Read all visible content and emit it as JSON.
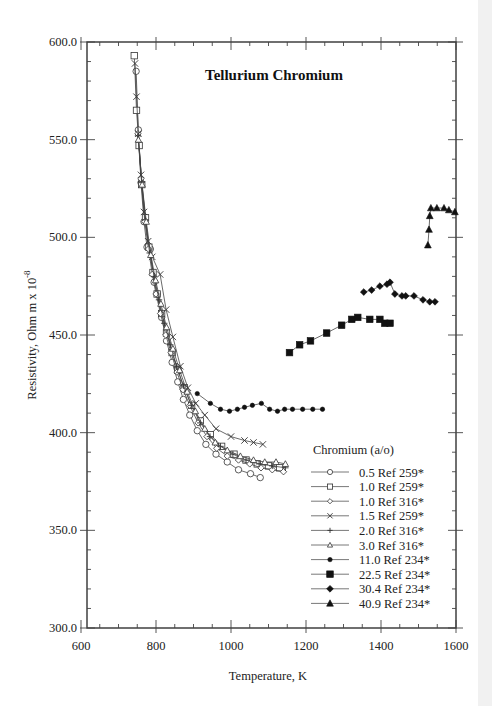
{
  "chart_data": {
    "type": "line",
    "title": "Tellurium  Chromium",
    "xlabel": "Temperature,  K",
    "ylabel": "Resistivity, Ohm m x 10",
    "ylabel_exponent": "-8",
    "xlim": [
      600,
      1600
    ],
    "ylim": [
      300,
      600
    ],
    "x_ticks": [
      "600",
      "800",
      "1000",
      "1200",
      "1400",
      "1600"
    ],
    "y_ticks": [
      "300.0",
      "350.0",
      "400.0",
      "450.0",
      "500.0",
      "550.0",
      "600.0"
    ],
    "grid": false,
    "legend_title": "Chromium (a/o)",
    "legend_position": "lower right",
    "series": [
      {
        "name": "0.5 Ref 259*",
        "marker": "circle-open",
        "points": [
          [
            747,
            585
          ],
          [
            753,
            555
          ],
          [
            760,
            528
          ],
          [
            768,
            508
          ],
          [
            776,
            495
          ],
          [
            785,
            494
          ],
          [
            795,
            477
          ],
          [
            803,
            471
          ],
          [
            815,
            459
          ],
          [
            828,
            447
          ],
          [
            843,
            436
          ],
          [
            858,
            426
          ],
          [
            873,
            417
          ],
          [
            890,
            409
          ],
          [
            910,
            401
          ],
          [
            933,
            394
          ],
          [
            960,
            389
          ],
          [
            990,
            385
          ],
          [
            1020,
            381
          ],
          [
            1052,
            379
          ],
          [
            1078,
            377
          ]
        ]
      },
      {
        "name": "1.0 Ref 259*",
        "marker": "square-open",
        "points": [
          [
            742,
            593
          ],
          [
            748,
            565
          ],
          [
            755,
            547
          ],
          [
            762,
            527
          ],
          [
            772,
            510
          ],
          [
            781,
            495
          ],
          [
            792,
            482
          ],
          [
            803,
            471
          ],
          [
            815,
            461
          ],
          [
            828,
            451
          ],
          [
            843,
            441
          ],
          [
            858,
            432
          ],
          [
            875,
            423
          ],
          [
            895,
            414
          ],
          [
            918,
            406
          ],
          [
            945,
            399
          ],
          [
            975,
            393
          ],
          [
            1008,
            389
          ],
          [
            1040,
            386
          ],
          [
            1070,
            384
          ],
          [
            1100,
            383
          ],
          [
            1130,
            382
          ]
        ]
      },
      {
        "name": "1.0 Ref 316*",
        "marker": "diamond-open",
        "points": [
          [
            752,
            553
          ],
          [
            760,
            530
          ],
          [
            770,
            508
          ],
          [
            780,
            494
          ],
          [
            790,
            481
          ],
          [
            800,
            471
          ],
          [
            812,
            461
          ],
          [
            826,
            450
          ],
          [
            840,
            441
          ],
          [
            856,
            431
          ],
          [
            872,
            422
          ],
          [
            890,
            414
          ],
          [
            912,
            405
          ],
          [
            936,
            398
          ],
          [
            962,
            392
          ],
          [
            990,
            388
          ],
          [
            1020,
            386
          ],
          [
            1050,
            384
          ],
          [
            1080,
            382
          ],
          [
            1110,
            381
          ],
          [
            1140,
            380
          ]
        ]
      },
      {
        "name": "1.5 Ref 259*",
        "marker": "x",
        "points": [
          [
            744,
            589
          ],
          [
            748,
            572
          ],
          [
            753,
            553
          ],
          [
            760,
            532
          ],
          [
            768,
            513
          ],
          [
            779,
            498
          ],
          [
            790,
            490
          ],
          [
            811,
            481
          ],
          [
            827,
            463
          ],
          [
            845,
            449
          ],
          [
            865,
            434
          ],
          [
            885,
            423
          ],
          [
            906,
            415
          ],
          [
            930,
            409
          ],
          [
            960,
            402
          ],
          [
            1000,
            398
          ],
          [
            1036,
            396
          ],
          [
            1060,
            395
          ],
          [
            1085,
            394
          ]
        ]
      },
      {
        "name": "2.0 Ref 316*",
        "marker": "plus",
        "points": [
          [
            752,
            552
          ],
          [
            762,
            528
          ],
          [
            772,
            509
          ],
          [
            783,
            492
          ],
          [
            795,
            480
          ],
          [
            808,
            468
          ],
          [
            822,
            456
          ],
          [
            838,
            445
          ],
          [
            855,
            434
          ],
          [
            873,
            424
          ],
          [
            894,
            414
          ],
          [
            918,
            405
          ],
          [
            944,
            398
          ],
          [
            972,
            393
          ],
          [
            1005,
            389
          ],
          [
            1040,
            386
          ],
          [
            1075,
            384
          ],
          [
            1110,
            383
          ],
          [
            1145,
            382
          ]
        ]
      },
      {
        "name": "3.0 Ref 316*",
        "marker": "triangle-open",
        "points": [
          [
            753,
            550
          ],
          [
            763,
            527
          ],
          [
            774,
            508
          ],
          [
            786,
            491
          ],
          [
            799,
            478
          ],
          [
            813,
            466
          ],
          [
            828,
            454
          ],
          [
            845,
            443
          ],
          [
            863,
            432
          ],
          [
            883,
            421
          ],
          [
            905,
            411
          ],
          [
            930,
            402
          ],
          [
            958,
            395
          ],
          [
            990,
            391
          ],
          [
            1025,
            388
          ],
          [
            1060,
            386
          ],
          [
            1090,
            385
          ],
          [
            1120,
            385
          ],
          [
            1145,
            384
          ]
        ]
      },
      {
        "name": "11.0 Ref 234*",
        "marker": "circle-filled",
        "points": [
          [
            910,
            420
          ],
          [
            945,
            415
          ],
          [
            972,
            412
          ],
          [
            996,
            411
          ],
          [
            1017,
            412
          ],
          [
            1036,
            413
          ],
          [
            1057,
            414
          ],
          [
            1081,
            415
          ],
          [
            1103,
            412
          ],
          [
            1124,
            411
          ],
          [
            1143,
            412
          ],
          [
            1164,
            412
          ],
          [
            1191,
            412
          ],
          [
            1218,
            412
          ],
          [
            1244,
            412
          ]
        ]
      },
      {
        "name": "22.5 Ref 234*",
        "marker": "square-filled",
        "points": [
          [
            1156,
            441
          ],
          [
            1183,
            445
          ],
          [
            1212,
            447
          ],
          [
            1255,
            451
          ],
          [
            1295,
            455
          ],
          [
            1322,
            458
          ],
          [
            1338,
            459
          ],
          [
            1370,
            458
          ],
          [
            1397,
            458
          ],
          [
            1410,
            456
          ],
          [
            1424,
            456
          ]
        ]
      },
      {
        "name": "30.4 Ref 234*",
        "marker": "diamond-filled",
        "points": [
          [
            1354,
            472
          ],
          [
            1375,
            473
          ],
          [
            1397,
            475
          ],
          [
            1416,
            476
          ],
          [
            1424,
            477
          ],
          [
            1437,
            471
          ],
          [
            1456,
            470
          ],
          [
            1466,
            470
          ],
          [
            1488,
            470
          ],
          [
            1512,
            468
          ],
          [
            1530,
            467
          ],
          [
            1544,
            467
          ]
        ]
      },
      {
        "name": "40.9 Ref 234*",
        "marker": "triangle-filled",
        "points": [
          [
            1525,
            496
          ],
          [
            1528,
            504
          ],
          [
            1530,
            511
          ],
          [
            1533,
            515
          ],
          [
            1549,
            515
          ],
          [
            1568,
            515
          ],
          [
            1581,
            514
          ],
          [
            1597,
            513
          ]
        ]
      }
    ]
  }
}
